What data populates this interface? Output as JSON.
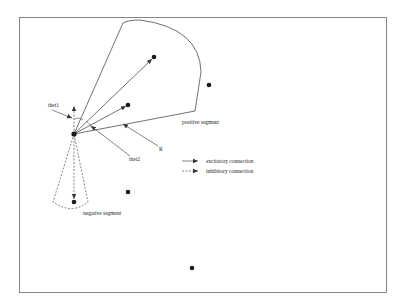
{
  "diagram": {
    "labels": {
      "theta1": "thet1",
      "theta2": "thet2",
      "radius": "R",
      "positive_segment": "positive segment",
      "negative_segment": "negative segment"
    },
    "legend": {
      "excitatory": "excitatory connection",
      "inhibitory": "inhibitory connection"
    },
    "colors": {
      "line": "#333333",
      "node": "#1a1a1a",
      "border": "#666666"
    }
  }
}
